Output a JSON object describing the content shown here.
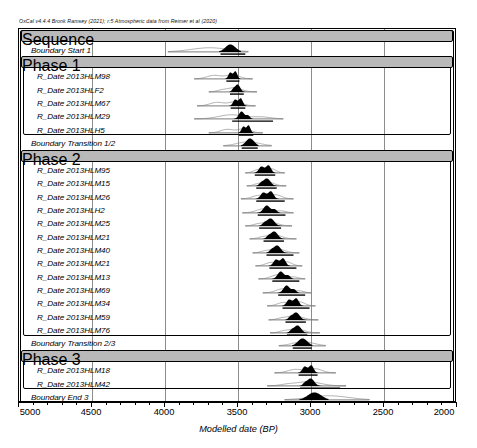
{
  "credit": "OxCal v4.4.4 Bronk Ramsey (2021); r:5 Atmospheric data from Reimer et al (2020)",
  "axis": {
    "title": "Modelled date (BP)",
    "ticks": [
      5000,
      4500,
      4000,
      3500,
      3000,
      2500,
      2000
    ],
    "min": 2000,
    "max": 5000,
    "minor_step": 100,
    "direction": "reversed"
  },
  "colors": {
    "band_header_fill": "#b9b9b9",
    "posterior_fill": "#000000",
    "prior_outline": "#7d7d7d",
    "grid": "#8c8c8c",
    "frame": "#000000"
  },
  "chart_data": {
    "type": "bar",
    "xlabel": "Modelled date (BP)",
    "ylabel": "",
    "xlim": [
      5000,
      2000
    ],
    "grid": true,
    "legend": "none",
    "categories": [
      "Sequence",
      "Boundary Start 1",
      "Phase 1",
      "R_Date 2013HLM98",
      "R_Date 2013HLF2",
      "R_Date 2013HLM67",
      "R_Date 2013HLM29",
      "R_Date 2013HLH5",
      "Boundary Transition 1/2",
      "Phase 2",
      "R_Date 2013HLM95",
      "R_Date 2013HLM15",
      "R_Date 2013HLM26",
      "R_Date 2013HLH2",
      "R_Date 2013HLM25",
      "R_Date 2013HLM21",
      "R_Date 2013HLM40",
      "R_Date 2013HLM21",
      "R_Date 2013HLM13",
      "R_Date 2013HLM69",
      "R_Date 2013HLM34",
      "R_Date 2013HLM59",
      "R_Date 2013HLM76",
      "Boundary Transition 2/3",
      "Phase 3",
      "R_Date 2013HLM18",
      "R_Date 2013HLM42",
      "Boundary End 3"
    ],
    "values": [
      null,
      3560,
      null,
      3540,
      3510,
      3500,
      3470,
      3440,
      3420,
      null,
      3310,
      3300,
      3290,
      3280,
      3270,
      3250,
      3230,
      3210,
      3190,
      3150,
      3120,
      3100,
      3090,
      3060,
      null,
      3020,
      3010,
      2980
    ]
  },
  "rows": [
    {
      "kind": "band",
      "label": "Sequence",
      "indent": 4
    },
    {
      "kind": "entry",
      "label": "Boundary Start 1",
      "indent": 12,
      "prior": [
        3980,
        3430
      ],
      "post": [
        3630,
        3480
      ],
      "peak": 3560,
      "shape": "wedge",
      "bars": [
        [
          3620,
          3450
        ]
      ]
    },
    {
      "kind": "band",
      "label": "Phase 1",
      "indent": 10
    },
    {
      "kind": "entry",
      "label": "R_Date 2013HLM98",
      "indent": 18,
      "prior": [
        3800,
        3400
      ],
      "post": [
        3590,
        3480
      ],
      "peak": 3545,
      "shape": "twin",
      "bars": [
        [
          3580,
          3490
        ]
      ]
    },
    {
      "kind": "entry",
      "label": "R_Date 2013HLF2",
      "indent": 18,
      "prior": [
        3700,
        3370
      ],
      "post": [
        3560,
        3450
      ],
      "peak": 3510,
      "shape": "hump",
      "bars": [
        [
          3555,
          3460
        ]
      ]
    },
    {
      "kind": "entry",
      "label": "R_Date 2013HLM67",
      "indent": 18,
      "prior": [
        3780,
        3380
      ],
      "post": [
        3560,
        3440
      ],
      "peak": 3500,
      "shape": "twin",
      "bars": [
        [
          3550,
          3450
        ]
      ]
    },
    {
      "kind": "entry",
      "label": "R_Date 2013HLM29",
      "indent": 18,
      "prior": [
        3800,
        3190
      ],
      "post": [
        3530,
        3400
      ],
      "peak": 3470,
      "shape": "hump2",
      "bars": [
        [
          3540,
          3260
        ]
      ]
    },
    {
      "kind": "entry",
      "label": "R_Date 2013HLH5",
      "indent": 18,
      "prior": [
        3700,
        3330
      ],
      "post": [
        3500,
        3390
      ],
      "peak": 3440,
      "shape": "twin",
      "bars": [
        [
          3495,
          3395
        ]
      ]
    },
    {
      "kind": "entry",
      "label": "Boundary Transition 1/2",
      "indent": 12,
      "prior": [
        3600,
        3270
      ],
      "post": [
        3480,
        3360
      ],
      "peak": 3420,
      "shape": "wedge",
      "bars": [
        [
          3475,
          3365
        ]
      ]
    },
    {
      "kind": "band",
      "label": "Phase 2",
      "indent": 10
    },
    {
      "kind": "entry",
      "label": "R_Date 2013HLM95",
      "indent": 18,
      "prior": [
        3450,
        3180
      ],
      "post": [
        3390,
        3240
      ],
      "peak": 3310,
      "shape": "twin",
      "bars": [
        [
          3385,
          3245
        ]
      ]
    },
    {
      "kind": "entry",
      "label": "R_Date 2013HLM15",
      "indent": 18,
      "prior": [
        3440,
        3170
      ],
      "post": [
        3380,
        3230
      ],
      "peak": 3300,
      "shape": "hump",
      "bars": [
        [
          3375,
          3235
        ]
      ]
    },
    {
      "kind": "entry",
      "label": "R_Date 2013HLM26",
      "indent": 18,
      "prior": [
        3480,
        3120
      ],
      "post": [
        3380,
        3220
      ],
      "peak": 3290,
      "shape": "twin",
      "bars": [
        [
          3375,
          3180
        ]
      ]
    },
    {
      "kind": "entry",
      "label": "R_Date 2013HLH2",
      "indent": 18,
      "prior": [
        3470,
        3120
      ],
      "post": [
        3370,
        3210
      ],
      "peak": 3280,
      "shape": "hump2",
      "bars": [
        [
          3365,
          3175
        ]
      ]
    },
    {
      "kind": "entry",
      "label": "R_Date 2013HLM25",
      "indent": 18,
      "prior": [
        3450,
        3130
      ],
      "post": [
        3360,
        3200
      ],
      "peak": 3270,
      "shape": "hump",
      "bars": [
        [
          3355,
          3205
        ]
      ]
    },
    {
      "kind": "entry",
      "label": "R_Date 2013HLM21",
      "indent": 18,
      "prior": [
        3420,
        3100
      ],
      "post": [
        3330,
        3180
      ],
      "peak": 3250,
      "shape": "hump",
      "bars": [
        [
          3325,
          3185
        ]
      ]
    },
    {
      "kind": "entry",
      "label": "R_Date 2013HLM40",
      "indent": 18,
      "prior": [
        3400,
        3080
      ],
      "post": [
        3310,
        3160
      ],
      "peak": 3230,
      "shape": "hump",
      "bars": [
        [
          3305,
          3120
        ]
      ]
    },
    {
      "kind": "entry",
      "label": "R_Date 2013HLM21",
      "indent": 18,
      "prior": [
        3380,
        3060
      ],
      "post": [
        3290,
        3140
      ],
      "peak": 3210,
      "shape": "twin",
      "bars": [
        [
          3285,
          3100
        ]
      ]
    },
    {
      "kind": "entry",
      "label": "R_Date 2013HLM13",
      "indent": 18,
      "prior": [
        3360,
        3040
      ],
      "post": [
        3270,
        3120
      ],
      "peak": 3190,
      "shape": "hump2",
      "bars": [
        [
          3265,
          3080
        ]
      ]
    },
    {
      "kind": "entry",
      "label": "R_Date 2013HLM69",
      "indent": 18,
      "prior": [
        3330,
        3000
      ],
      "post": [
        3230,
        3080
      ],
      "peak": 3150,
      "shape": "hump2",
      "bars": [
        [
          3225,
          3040
        ]
      ]
    },
    {
      "kind": "entry",
      "label": "R_Date 2013HLM34",
      "indent": 18,
      "prior": [
        3300,
        2970
      ],
      "post": [
        3200,
        3050
      ],
      "peak": 3120,
      "shape": "twin",
      "bars": [
        [
          3195,
          3010
        ]
      ]
    },
    {
      "kind": "entry",
      "label": "R_Date 2013HLM59",
      "indent": 18,
      "prior": [
        3290,
        2950
      ],
      "post": [
        3180,
        3030
      ],
      "peak": 3100,
      "shape": "hump",
      "bars": [
        [
          3175,
          3035
        ]
      ]
    },
    {
      "kind": "entry",
      "label": "R_Date 2013HLM76",
      "indent": 18,
      "prior": [
        3280,
        2940
      ],
      "post": [
        3170,
        3020
      ],
      "peak": 3090,
      "shape": "hump",
      "bars": [
        [
          3165,
          3025
        ]
      ]
    },
    {
      "kind": "entry",
      "label": "Boundary Transition 2/3",
      "indent": 12,
      "prior": [
        3220,
        2900
      ],
      "post": [
        3130,
        2990
      ],
      "peak": 3060,
      "shape": "wedge",
      "bars": [
        [
          3125,
          2995
        ]
      ]
    },
    {
      "kind": "band",
      "label": "Phase 3",
      "indent": 10
    },
    {
      "kind": "entry",
      "label": "R_Date 2013HLM18",
      "indent": 18,
      "prior": [
        3250,
        2830
      ],
      "post": [
        3090,
        2950
      ],
      "peak": 3020,
      "shape": "twin",
      "bars": [
        [
          3085,
          2955
        ]
      ]
    },
    {
      "kind": "entry",
      "label": "R_Date 2013HLM42",
      "indent": 18,
      "prior": [
        3300,
        2760
      ],
      "post": [
        3080,
        2930
      ],
      "peak": 3010,
      "shape": "hump",
      "bars": [
        [
          3075,
          2800
        ]
      ]
    },
    {
      "kind": "entry",
      "label": "Boundary End 3",
      "indent": 12,
      "prior": [
        3180,
        2600
      ],
      "post": [
        3080,
        2880
      ],
      "peak": 2980,
      "shape": "wedge",
      "bars": [
        [
          3075,
          2885
        ]
      ]
    }
  ],
  "groups": [
    {
      "name": "sequence-frame",
      "from": 0,
      "to": 27
    },
    {
      "name": "phase1-frame",
      "from": 2,
      "to": 7
    },
    {
      "name": "phase2-frame",
      "from": 9,
      "to": 22
    },
    {
      "name": "phase3-frame",
      "from": 24,
      "to": 26
    }
  ]
}
